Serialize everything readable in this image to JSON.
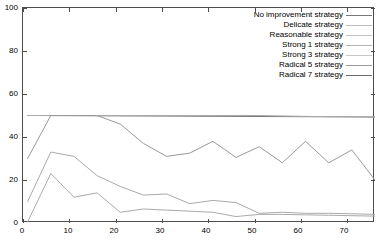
{
  "chart_data": {
    "type": "line",
    "title": "",
    "xlabel": "",
    "ylabel": "",
    "xlim": [
      0,
      76
    ],
    "ylim": [
      0,
      100
    ],
    "xticks": [
      0,
      10,
      20,
      30,
      40,
      50,
      60,
      70
    ],
    "yticks": [
      0,
      20,
      40,
      60,
      80,
      100
    ],
    "grid": false,
    "legend_position": "upper-right",
    "series": [
      {
        "name": "No improvement strategy",
        "color": "#777777",
        "x": [
          1,
          76
        ],
        "values": [
          50,
          49.3
        ]
      },
      {
        "name": "Delicate strategy",
        "color": "#aaaaaa",
        "x": [
          1,
          6,
          11,
          16,
          21,
          26,
          31,
          36,
          41,
          46,
          51,
          56,
          61,
          66,
          71,
          76
        ],
        "values": [
          50,
          50,
          50,
          50,
          50,
          50,
          50,
          50,
          50,
          50,
          50,
          49.8,
          49.6,
          49.5,
          49.4,
          49.3
        ]
      },
      {
        "name": "Reasonable strategy",
        "color": "#999999",
        "x": [
          1,
          6,
          11,
          16,
          21,
          26,
          31,
          36,
          41,
          46,
          51,
          56,
          61,
          66,
          71,
          76
        ],
        "values": [
          30,
          50,
          50,
          50,
          46,
          37,
          31,
          32.5,
          38,
          30.5,
          35.5,
          28,
          38,
          28,
          34,
          20
        ]
      },
      {
        "name": "Strong 1 strategy",
        "color": "#aaaaaa",
        "x": [
          1,
          6,
          11,
          16,
          21,
          26,
          31,
          36,
          41,
          46,
          51,
          56,
          61,
          66,
          71,
          76
        ],
        "values": [
          10,
          33,
          31,
          22,
          17,
          13,
          13.5,
          9,
          10.5,
          9.5,
          4.5,
          5,
          4.5,
          4.5,
          4.3,
          4
        ]
      },
      {
        "name": "Strong 3 strategy",
        "color": "#aaaaaa",
        "x": [
          1,
          6,
          11,
          16,
          21,
          26,
          31,
          36,
          41,
          46,
          51,
          56,
          61,
          66,
          71,
          76
        ],
        "values": [
          0.5,
          23,
          12,
          14,
          5,
          6.5,
          6,
          5.5,
          5,
          3,
          4,
          4,
          3.8,
          3.6,
          3.4,
          3.2
        ]
      },
      {
        "name": "Radical 5 strategy",
        "color": "#999999",
        "x": [],
        "values": []
      },
      {
        "name": "Radical 7 strategy",
        "color": "#666666",
        "x": [],
        "values": []
      }
    ]
  },
  "legend": {
    "items": [
      {
        "label": "No improvement strategy",
        "color": "#777777"
      },
      {
        "label": "Delicate strategy",
        "color": "#bbbbbb"
      },
      {
        "label": "Reasonable strategy",
        "color": "#c2c2c2"
      },
      {
        "label": "Strong 1 strategy",
        "color": "#b5b5b5"
      },
      {
        "label": "Strong 3 strategy",
        "color": "#c8c8c8"
      },
      {
        "label": "Radical 5 strategy",
        "color": "#9a9a9a"
      },
      {
        "label": "Radical 7 strategy",
        "color": "#6b6b6b"
      }
    ]
  },
  "axes": {
    "y_tick_labels": [
      "100",
      "80",
      "60",
      "40",
      "20",
      "0"
    ],
    "x_tick_labels": [
      "0",
      "10",
      "20",
      "30",
      "40",
      "50",
      "60",
      "70"
    ]
  }
}
